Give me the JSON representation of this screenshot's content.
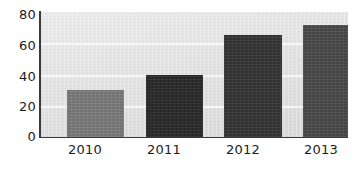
{
  "chart_data": {
    "type": "bar",
    "title": "",
    "subtitle": "",
    "xlabel": "",
    "ylabel": "",
    "categories": [
      "2010",
      "2011",
      "2012",
      "2013"
    ],
    "values": [
      30,
      40,
      65,
      72
    ],
    "series": [
      {
        "name": "",
        "values": [
          30,
          40,
          65,
          72
        ]
      }
    ],
    "ylim": [
      0,
      80
    ],
    "yticks": [
      "0",
      "20",
      "40",
      "60",
      "80"
    ],
    "ytick_values": [
      0,
      20,
      40,
      60,
      80
    ],
    "grid": "horizontal",
    "legend": "none",
    "bar_colors": [
      "#7d7d7d",
      "#2b2b2b",
      "#363636",
      "#4c4c4c"
    ],
    "panel_color": "#e2e2e2",
    "gridline_color": "#f6f6f6",
    "axis_color": "#3a3a3a",
    "text_color": "#1c1c1c"
  }
}
